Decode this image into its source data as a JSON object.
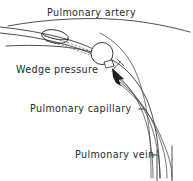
{
  "diagram": {
    "title_visible": false,
    "background_color": "#ffffff",
    "ink_color": "#2b2b2b",
    "labels": [
      {
        "id": "pulmonary-artery",
        "text": "Pulmonary artery",
        "x": 47,
        "y": 16,
        "has_pointer": false
      },
      {
        "id": "wedge-pressure",
        "text": "Wedge pressure",
        "x": 16,
        "y": 73,
        "has_pointer": true
      },
      {
        "id": "pulmonary-capillary",
        "text": "Pulmonary capillary",
        "x": 30,
        "y": 112,
        "has_pointer": true
      },
      {
        "id": "pulmonary-vein",
        "text": "Pulmonary vein",
        "x": 75,
        "y": 158,
        "has_pointer": true
      }
    ],
    "structures": [
      {
        "id": "pulmonary-artery-upper-wall",
        "kind": "vessel-wall"
      },
      {
        "id": "pulmonary-artery-lower-wall",
        "kind": "vessel-wall"
      },
      {
        "id": "catheter-shaft",
        "kind": "catheter"
      },
      {
        "id": "catheter-proximal-balloon",
        "kind": "balloon"
      },
      {
        "id": "catheter-distal-balloon",
        "kind": "balloon"
      },
      {
        "id": "catheter-tip",
        "kind": "catheter-tip"
      },
      {
        "id": "pulmonary-capillary-bed",
        "kind": "vessel-branch"
      },
      {
        "id": "pulmonary-vein-trunk",
        "kind": "vessel-wall"
      },
      {
        "id": "blood-flow-arrow",
        "kind": "arrow"
      }
    ]
  }
}
